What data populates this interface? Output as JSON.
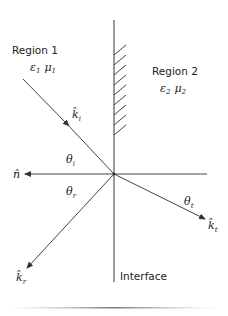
{
  "diagram": {
    "regions": [
      {
        "name": "Region 1",
        "params": [
          "ε",
          "1",
          "μ",
          "1"
        ]
      },
      {
        "name": "Region 2",
        "params": [
          "ε",
          "2",
          "μ",
          "2"
        ]
      }
    ],
    "interface_label": "Interface",
    "normal_label": {
      "base": "n̂"
    },
    "wave_vectors": {
      "incident": {
        "base": "k̂",
        "sub": "i"
      },
      "reflected": {
        "base": "k̂",
        "sub": "r"
      },
      "transmitted": {
        "base": "k̂",
        "sub": "t"
      }
    },
    "angles": {
      "incident": {
        "base": "θ",
        "sub": "i"
      },
      "reflected": {
        "base": "θ",
        "sub": "r"
      },
      "transmitted": {
        "base": "θ",
        "sub": "t"
      }
    },
    "colors": {
      "line": "#444444",
      "text": "#222222",
      "divider": "#999999"
    }
  }
}
